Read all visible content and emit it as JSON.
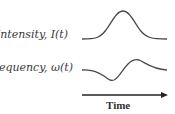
{
  "labels": {
    "intensity": "Intensity, I(t)",
    "frequency": "Frequency, ω(t)",
    "time_axis": "Time"
  },
  "colors": {
    "curve": "#4a4a4a",
    "text": "#3a3a3a"
  }
}
